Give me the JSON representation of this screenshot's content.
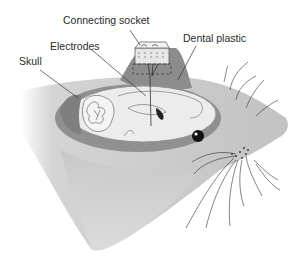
{
  "diagram": {
    "labels": {
      "connecting_socket": "Connecting socket",
      "dental_plastic": "Dental plastic",
      "electrodes": "Electrodes",
      "skull": "Skull"
    },
    "colors": {
      "background": "#ffffff",
      "head_fill": "#c8c8c8",
      "head_dark": "#9a9a9a",
      "skull_fill": "#8e8e8e",
      "brain_fill": "#ececec",
      "brain_outline": "#7a7a7a",
      "plastic_fill": "#8a8a8a",
      "socket_fill": "#e6e6e6",
      "text": "#2a2a2a",
      "lines": "#333333"
    }
  }
}
